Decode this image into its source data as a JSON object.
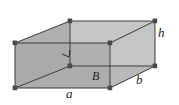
{
  "figure": {
    "type": "rectangular-prism-diagram",
    "background_color": "#ffffff",
    "stroke_color": "#3a3a3a",
    "vertex_color": "#4a4a4a",
    "faces": {
      "front_face_fill": "#a8a8a8",
      "left_wedge_fill": "#b4b4b4",
      "top_face_fill": "#e8e8e8",
      "right_face_fill": "#cfcfcf",
      "back_face_fill": "#d8d8d8"
    },
    "labels": [
      {
        "id": "h",
        "text": "h",
        "meaning": "height-edge-label",
        "x": 158,
        "y": 26
      },
      {
        "id": "b",
        "text": "b",
        "meaning": "depth-edge-label",
        "x": 136,
        "y": 73
      },
      {
        "id": "B",
        "text": "B",
        "meaning": "base-area-label",
        "x": 92,
        "y": 70
      },
      {
        "id": "a",
        "text": "a",
        "meaning": "width-edge-label",
        "x": 66,
        "y": 87
      }
    ],
    "vertices": {
      "front_bottom_left": [
        15,
        88
      ],
      "front_bottom_right": [
        110,
        88
      ],
      "front_top_left": [
        15,
        43
      ],
      "front_top_right": [
        110,
        43
      ],
      "back_bottom_left": [
        70,
        66
      ],
      "back_bottom_right": [
        155,
        66
      ],
      "back_top_left": [
        70,
        21
      ],
      "back_top_right": [
        155,
        21
      ]
    },
    "right_angle_mark": {
      "at_vertex": "back_bottom_left",
      "visible": true
    }
  }
}
